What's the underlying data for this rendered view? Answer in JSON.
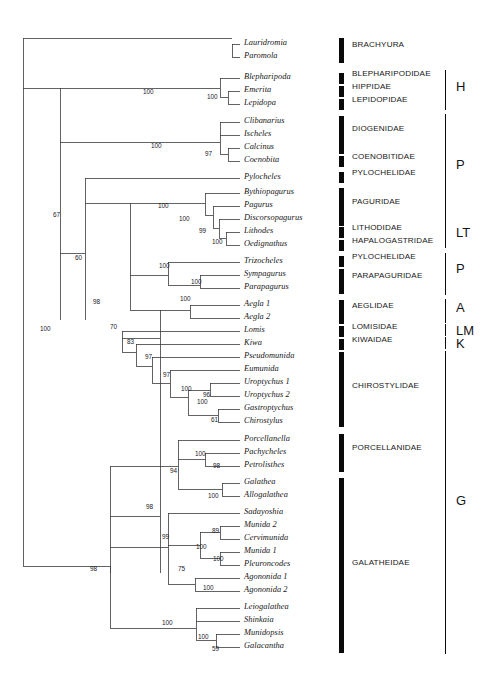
{
  "figure": {
    "type": "phylogenetic-cladogram",
    "taxa_count": 47,
    "support_type": "bootstrap"
  },
  "taxa": [
    {
      "name": "Lauridromia",
      "y": 44
    },
    {
      "name": "Paromola",
      "y": 57
    },
    {
      "name": "Blepharipoda",
      "y": 78
    },
    {
      "name": "Emerita",
      "y": 91
    },
    {
      "name": "Lepidopa",
      "y": 104
    },
    {
      "name": "Clibanarius",
      "y": 122
    },
    {
      "name": "Ischeles",
      "y": 135
    },
    {
      "name": "Calcinus",
      "y": 148
    },
    {
      "name": "Coenobita",
      "y": 161
    },
    {
      "name": "Pylocheles",
      "y": 178
    },
    {
      "name": "Bythiopagurus",
      "y": 193
    },
    {
      "name": "Pagurus",
      "y": 206
    },
    {
      "name": "Discorsopagurus",
      "y": 219
    },
    {
      "name": "Lithodes",
      "y": 232
    },
    {
      "name": "Oedignathus",
      "y": 245
    },
    {
      "name": "Trizocheles",
      "y": 262
    },
    {
      "name": "Sympagurus",
      "y": 275
    },
    {
      "name": "Parapagurus",
      "y": 288
    },
    {
      "name": "Aegla 1",
      "y": 305
    },
    {
      "name": "Aegla 2",
      "y": 318
    },
    {
      "name": "Lomis",
      "y": 331
    },
    {
      "name": "Kiwa",
      "y": 344
    },
    {
      "name": "Pseudomunida",
      "y": 357
    },
    {
      "name": "Eumunida",
      "y": 370
    },
    {
      "name": "Uroptychus 1",
      "y": 383
    },
    {
      "name": "Uroptychus 2",
      "y": 396
    },
    {
      "name": "Gastroptychus",
      "y": 409
    },
    {
      "name": "Chirostylus",
      "y": 422
    },
    {
      "name": "Porcellanella",
      "y": 440
    },
    {
      "name": "Pachycheles",
      "y": 453
    },
    {
      "name": "Petrolisthes",
      "y": 466
    },
    {
      "name": "Galathea",
      "y": 483
    },
    {
      "name": "Allogalathea",
      "y": 496
    },
    {
      "name": "Sadayoshia",
      "y": 513
    },
    {
      "name": "Munida 2",
      "y": 526
    },
    {
      "name": "Cervimunida",
      "y": 539
    },
    {
      "name": "Munida 1",
      "y": 552
    },
    {
      "name": "Pleuroncodes",
      "y": 565
    },
    {
      "name": "Agononida 1",
      "y": 578
    },
    {
      "name": "Agononida 2",
      "y": 591
    },
    {
      "name": "Leiogalathea",
      "y": 608
    },
    {
      "name": "Shinkaia",
      "y": 621
    },
    {
      "name": "Munidopsis",
      "y": 634
    },
    {
      "name": "Galacantha",
      "y": 647
    }
  ],
  "supports": [
    {
      "value": "100",
      "x": 143,
      "y": 93
    },
    {
      "value": "100",
      "x": 207,
      "y": 98
    },
    {
      "value": "100",
      "x": 151,
      "y": 147
    },
    {
      "value": "97",
      "x": 205,
      "y": 155
    },
    {
      "value": "67",
      "x": 53,
      "y": 216
    },
    {
      "value": "100",
      "x": 158,
      "y": 207
    },
    {
      "value": "100",
      "x": 179,
      "y": 220
    },
    {
      "value": "99",
      "x": 199,
      "y": 232
    },
    {
      "value": "100",
      "x": 212,
      "y": 243
    },
    {
      "value": "60",
      "x": 75,
      "y": 259
    },
    {
      "value": "100",
      "x": 159,
      "y": 267
    },
    {
      "value": "100",
      "x": 191,
      "y": 283
    },
    {
      "value": "98",
      "x": 93,
      "y": 303
    },
    {
      "value": "100",
      "x": 180,
      "y": 300
    },
    {
      "value": "70",
      "x": 110,
      "y": 328
    },
    {
      "value": "83",
      "x": 127,
      "y": 343
    },
    {
      "value": "97",
      "x": 145,
      "y": 358
    },
    {
      "value": "97",
      "x": 163,
      "y": 376
    },
    {
      "value": "100",
      "x": 181,
      "y": 390
    },
    {
      "value": "96",
      "x": 203,
      "y": 396
    },
    {
      "value": "100",
      "x": 197,
      "y": 403
    },
    {
      "value": "61",
      "x": 211,
      "y": 421
    },
    {
      "value": "100",
      "x": 40,
      "y": 330
    },
    {
      "value": "94",
      "x": 170,
      "y": 472
    },
    {
      "value": "100",
      "x": 195,
      "y": 455
    },
    {
      "value": "98",
      "x": 213,
      "y": 467
    },
    {
      "value": "100",
      "x": 208,
      "y": 497
    },
    {
      "value": "98",
      "x": 146,
      "y": 508
    },
    {
      "value": "99",
      "x": 162,
      "y": 538
    },
    {
      "value": "89",
      "x": 212,
      "y": 532
    },
    {
      "value": "100",
      "x": 196,
      "y": 548
    },
    {
      "value": "100",
      "x": 213,
      "y": 560
    },
    {
      "value": "75",
      "x": 178,
      "y": 570
    },
    {
      "value": "100",
      "x": 203,
      "y": 589
    },
    {
      "value": "98",
      "x": 90,
      "y": 570
    },
    {
      "value": "100",
      "x": 162,
      "y": 624
    },
    {
      "value": "100",
      "x": 198,
      "y": 638
    },
    {
      "value": "59",
      "x": 212,
      "y": 650
    }
  ],
  "families": [
    {
      "label": "BRACHYURA",
      "bar_top": 38,
      "bar_height": 25,
      "label_y": 45
    },
    {
      "label": "BLEPHARIPODIDAE",
      "bar_top": 73,
      "bar_height": 11,
      "label_y": 74
    },
    {
      "label": "HIPPIDAE",
      "bar_top": 86,
      "bar_height": 11,
      "label_y": 87
    },
    {
      "label": "LEPIDOPIDAE",
      "bar_top": 99,
      "bar_height": 11,
      "label_y": 100
    },
    {
      "label": "DIOGENIDAE",
      "bar_top": 116,
      "bar_height": 38,
      "label_y": 129
    },
    {
      "label": "COENOBITIDAE",
      "bar_top": 156,
      "bar_height": 11,
      "label_y": 157
    },
    {
      "label": "PYLOCHELIDAE",
      "bar_top": 172,
      "bar_height": 11,
      "label_y": 173
    },
    {
      "label": "PAGURIDAE",
      "bar_top": 188,
      "bar_height": 38,
      "label_y": 202
    },
    {
      "label": "LITHODIDAE",
      "bar_top": 227,
      "bar_height": 11,
      "label_y": 228
    },
    {
      "label": "HAPALOGASTRIDAE",
      "bar_top": 240,
      "bar_height": 11,
      "label_y": 241
    },
    {
      "label": "PYLOCHELIDAE",
      "bar_top": 256,
      "bar_height": 11,
      "label_y": 257
    },
    {
      "label": "PARAPAGURIDAE",
      "bar_top": 269,
      "bar_height": 25,
      "label_y": 276
    },
    {
      "label": "AEGLIDAE",
      "bar_top": 300,
      "bar_height": 24,
      "label_y": 306
    },
    {
      "label": "LOMISIDAE",
      "bar_top": 326,
      "bar_height": 11,
      "label_y": 327
    },
    {
      "label": "KIWAIDAE",
      "bar_top": 339,
      "bar_height": 11,
      "label_y": 340
    },
    {
      "label": "CHIROSTYLIDAE",
      "bar_top": 352,
      "bar_height": 75,
      "label_y": 386
    },
    {
      "label": "PORCELLANIDAE",
      "bar_top": 434,
      "bar_height": 38,
      "label_y": 448
    },
    {
      "label": "GALATHEIDAE",
      "bar_top": 478,
      "bar_height": 175,
      "label_y": 563
    }
  ],
  "groups": [
    {
      "letter": "H",
      "line_top": 70,
      "line_height": 40,
      "letter_y": 80
    },
    {
      "letter": "P",
      "line_top": 114,
      "line_height": 112,
      "letter_y": 158
    },
    {
      "letter": "LT",
      "line_top": 224,
      "line_height": 24,
      "letter_y": 226
    },
    {
      "letter": "P",
      "line_top": 253,
      "line_height": 42,
      "letter_y": 262
    },
    {
      "letter": "A",
      "line_top": 299,
      "line_height": 24,
      "letter_y": 301
    },
    {
      "letter": "LM",
      "line_top": 324,
      "line_height": 12,
      "letter_y": 324
    },
    {
      "letter": "K",
      "line_top": 337,
      "line_height": 12,
      "letter_y": 337
    },
    {
      "letter": "G",
      "line_top": 351,
      "line_height": 303,
      "letter_y": 494
    }
  ],
  "tree_lines": {
    "stroke": "#3c3c3c",
    "stroke_width": 0.8,
    "segments": [
      [
        23,
        38,
        23,
        566
      ],
      [
        23,
        38,
        232,
        38
      ],
      [
        232,
        44,
        232,
        57
      ],
      [
        232,
        44,
        240,
        44
      ],
      [
        232,
        57,
        240,
        57
      ],
      [
        23,
        88,
        60,
        88
      ],
      [
        60,
        88,
        60,
        320
      ],
      [
        60,
        88,
        220,
        88
      ],
      [
        220,
        78,
        220,
        97
      ],
      [
        220,
        78,
        240,
        78
      ],
      [
        220,
        97,
        228,
        97
      ],
      [
        228,
        91,
        228,
        104
      ],
      [
        228,
        91,
        240,
        91
      ],
      [
        228,
        104,
        240,
        104
      ],
      [
        60,
        142,
        220,
        142
      ],
      [
        220,
        122,
        220,
        154
      ],
      [
        220,
        122,
        240,
        122
      ],
      [
        220,
        135,
        240,
        135
      ],
      [
        220,
        154,
        228,
        154
      ],
      [
        228,
        148,
        228,
        161
      ],
      [
        228,
        148,
        240,
        148
      ],
      [
        228,
        161,
        240,
        161
      ],
      [
        60,
        253,
        85,
        253
      ],
      [
        85,
        178,
        85,
        320
      ],
      [
        85,
        178,
        240,
        178
      ],
      [
        85,
        203,
        130,
        203
      ],
      [
        130,
        203,
        130,
        310
      ],
      [
        130,
        203,
        205,
        203
      ],
      [
        205,
        193,
        205,
        215
      ],
      [
        205,
        193,
        240,
        193
      ],
      [
        205,
        215,
        213,
        215
      ],
      [
        213,
        206,
        213,
        228
      ],
      [
        213,
        206,
        240,
        206
      ],
      [
        213,
        228,
        219,
        228
      ],
      [
        219,
        219,
        219,
        238
      ],
      [
        219,
        219,
        240,
        219
      ],
      [
        219,
        238,
        226,
        238
      ],
      [
        226,
        232,
        226,
        245
      ],
      [
        226,
        232,
        240,
        232
      ],
      [
        226,
        245,
        240,
        245
      ],
      [
        130,
        275,
        168,
        275
      ],
      [
        168,
        262,
        168,
        285
      ],
      [
        168,
        262,
        240,
        262
      ],
      [
        168,
        285,
        200,
        285
      ],
      [
        200,
        275,
        200,
        288
      ],
      [
        200,
        275,
        240,
        275
      ],
      [
        200,
        288,
        240,
        288
      ],
      [
        130,
        310,
        160,
        310
      ],
      [
        160,
        310,
        160,
        573
      ],
      [
        160,
        310,
        190,
        310
      ],
      [
        190,
        305,
        190,
        318
      ],
      [
        190,
        305,
        240,
        305
      ],
      [
        190,
        318,
        240,
        318
      ],
      [
        160,
        338,
        122,
        338
      ],
      [
        122,
        331,
        122,
        352
      ],
      [
        122,
        331,
        240,
        331
      ],
      [
        122,
        352,
        136,
        352
      ],
      [
        136,
        344,
        136,
        366
      ],
      [
        136,
        344,
        240,
        344
      ],
      [
        136,
        366,
        152,
        366
      ],
      [
        152,
        357,
        152,
        383
      ],
      [
        152,
        357,
        240,
        357
      ],
      [
        152,
        383,
        170,
        383
      ],
      [
        170,
        370,
        170,
        397
      ],
      [
        170,
        370,
        240,
        370
      ],
      [
        170,
        397,
        188,
        397
      ],
      [
        188,
        390,
        188,
        415
      ],
      [
        188,
        390,
        210,
        390
      ],
      [
        210,
        383,
        210,
        396
      ],
      [
        210,
        383,
        240,
        383
      ],
      [
        210,
        396,
        240,
        396
      ],
      [
        188,
        415,
        218,
        415
      ],
      [
        218,
        409,
        218,
        422
      ],
      [
        218,
        409,
        240,
        409
      ],
      [
        218,
        422,
        240,
        422
      ],
      [
        160,
        516,
        110,
        516
      ],
      [
        110,
        466,
        110,
        573
      ],
      [
        110,
        466,
        178,
        466
      ],
      [
        178,
        440,
        178,
        489
      ],
      [
        178,
        440,
        240,
        440
      ],
      [
        178,
        489,
        222,
        489
      ],
      [
        222,
        483,
        222,
        496
      ],
      [
        222,
        483,
        240,
        483
      ],
      [
        222,
        496,
        240,
        496
      ],
      [
        178,
        459,
        205,
        459
      ],
      [
        205,
        453,
        205,
        466
      ],
      [
        205,
        453,
        240,
        453
      ],
      [
        205,
        466,
        240,
        466
      ],
      [
        110,
        547,
        168,
        547
      ],
      [
        168,
        513,
        168,
        584
      ],
      [
        168,
        513,
        240,
        513
      ],
      [
        168,
        584,
        195,
        584
      ],
      [
        195,
        578,
        195,
        591
      ],
      [
        195,
        578,
        240,
        578
      ],
      [
        195,
        591,
        240,
        591
      ],
      [
        168,
        545,
        200,
        545
      ],
      [
        200,
        532,
        200,
        558
      ],
      [
        200,
        532,
        220,
        532
      ],
      [
        220,
        526,
        220,
        539
      ],
      [
        220,
        526,
        240,
        526
      ],
      [
        220,
        539,
        240,
        539
      ],
      [
        200,
        558,
        220,
        558
      ],
      [
        220,
        552,
        220,
        565
      ],
      [
        220,
        552,
        240,
        552
      ],
      [
        220,
        565,
        240,
        565
      ],
      [
        23,
        566,
        110,
        566
      ],
      [
        160,
        628,
        196,
        628
      ],
      [
        196,
        608,
        196,
        640
      ],
      [
        196,
        608,
        240,
        608
      ],
      [
        196,
        621,
        240,
        621
      ],
      [
        196,
        640,
        216,
        640
      ],
      [
        216,
        634,
        216,
        647
      ],
      [
        216,
        634,
        240,
        634
      ],
      [
        216,
        647,
        240,
        647
      ],
      [
        110,
        628,
        160,
        628
      ],
      [
        110,
        566,
        110,
        628
      ]
    ]
  }
}
